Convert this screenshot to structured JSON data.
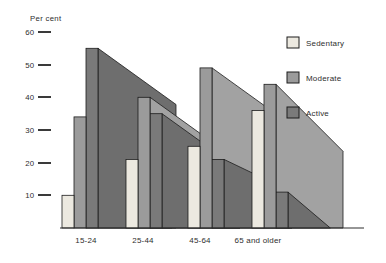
{
  "figure": {
    "kind": "3d-perspective grouped bar chart",
    "background": "#ffffff"
  },
  "y_axis": {
    "title": "Per cent",
    "ticks": [
      {
        "label": "60",
        "value": 60
      },
      {
        "label": "50",
        "value": 50
      },
      {
        "label": "40",
        "value": 40
      },
      {
        "label": "30",
        "value": 30
      },
      {
        "label": "20",
        "value": 20
      },
      {
        "label": "10",
        "value": 10
      }
    ]
  },
  "x_axis": {
    "labels": [
      "15-24",
      "25-44",
      "45-64",
      "65 and older"
    ]
  },
  "legend": {
    "position": "top-right",
    "items": [
      {
        "label": "Sedentary",
        "color": "#ece9e0"
      },
      {
        "label": "Moderate",
        "color": "#9b9b9b"
      },
      {
        "label": "Active",
        "color": "#7a7a7a"
      }
    ]
  },
  "colors": {
    "sedentary_fill": "#ece9e0",
    "moderate_fill": "#9b9b9b",
    "moderate_depth_fill": "#a2a2a2",
    "active_fill": "#7a7a7a",
    "active_depth_fill": "#6e6e6e",
    "outline": "#1c1c1c",
    "axis": "#2e2e2e"
  },
  "chart_data": {
    "type": "bar",
    "style": "pseudo-3d-perspective",
    "title": "Per cent",
    "xlabel": "",
    "ylabel": "Per cent",
    "ylim": [
      0,
      60
    ],
    "grid": false,
    "legend_position": "top-right",
    "categories": [
      "15-24",
      "25-44",
      "45-64",
      "65 and older"
    ],
    "series": [
      {
        "name": "Sedentary",
        "values": [
          10,
          21,
          25,
          36
        ]
      },
      {
        "name": "Moderate",
        "values": [
          34,
          40,
          49,
          44
        ]
      },
      {
        "name": "Active",
        "values": [
          55,
          35,
          21,
          11
        ]
      }
    ]
  }
}
